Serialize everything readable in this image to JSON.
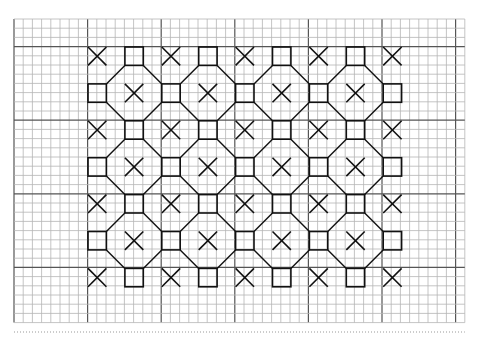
{
  "diagram": {
    "grid": {
      "x0": 14,
      "y0": 19,
      "cell": 9.2,
      "cols": 49,
      "rows": 33,
      "heavy_every": 8,
      "heavy_offset_col": 8,
      "heavy_offset_row": 3,
      "color": "#b5b5b5",
      "heavy_color": "#555555"
    },
    "motif": {
      "origin_x": 88,
      "origin_y": 47,
      "pitch": 36.9,
      "size": 18.4,
      "cols": 9,
      "rows": 7,
      "color": "#111111",
      "row_patterns": [
        [
          "X",
          "S",
          "X",
          "S",
          "X",
          "S",
          "X",
          "S",
          "X"
        ],
        [
          "S",
          "X",
          "S",
          "X",
          "S",
          "X",
          "S",
          "X",
          "S"
        ],
        [
          "X",
          "S",
          "X",
          "S",
          "X",
          "S",
          "X",
          "S",
          "X"
        ],
        [
          "S",
          "X",
          "S",
          "X",
          "S",
          "X",
          "S",
          "X",
          "S"
        ],
        [
          "X",
          "S",
          "X",
          "S",
          "X",
          "S",
          "X",
          "S",
          "X"
        ],
        [
          "S",
          "X",
          "S",
          "X",
          "S",
          "X",
          "S",
          "X",
          "S"
        ],
        [
          "X",
          "S",
          "X",
          "S",
          "X",
          "S",
          "X",
          "S",
          "X"
        ]
      ],
      "legend": {
        "X": "cross-stitch",
        "S": "square-stitch"
      }
    },
    "footer_dotted_line_y": 332
  }
}
